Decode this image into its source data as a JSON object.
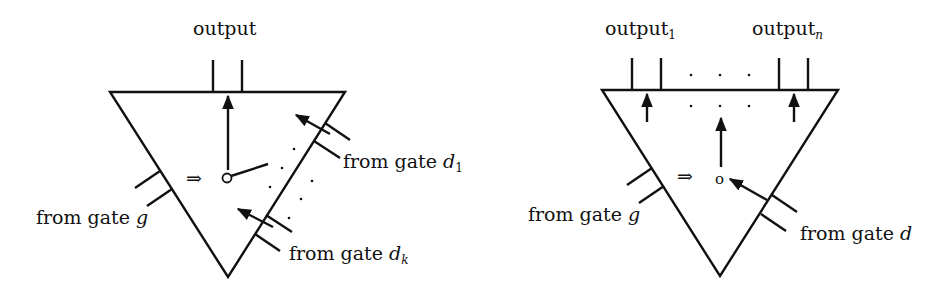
{
  "left_figure": {
    "output_label": "output",
    "gate_g_label": "from gate ",
    "gate_g_var": "g",
    "gate_d1_label": "from gate ",
    "gate_d1_var": "d",
    "gate_d1_sub": "1",
    "gate_dk_label": "from gate ",
    "gate_dk_var": "d",
    "gate_dk_sub": "k",
    "implies_symbol": "⇒",
    "node_symbol": "o"
  },
  "right_figure": {
    "output_1_label": "output",
    "output_1_sub": "1",
    "output_n_label": "output",
    "output_n_sub": "n",
    "gate_g_label": "from gate ",
    "gate_g_var": "g",
    "gate_d_label": "from gate ",
    "gate_d_var": "d",
    "implies_symbol": "⇒",
    "node_symbol": "o",
    "ellipsis": ". . ."
  },
  "colors": {
    "stroke": "#111111",
    "background": "#ffffff"
  }
}
